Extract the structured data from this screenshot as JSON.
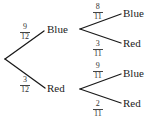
{
  "diagram": {
    "type": "probability-tree",
    "line_color": "#1a1a1a",
    "first_level": [
      {
        "outcome": "Blue",
        "probability": {
          "numerator": "9",
          "denominator": "12"
        },
        "second_level": [
          {
            "outcome": "Blue",
            "probability": {
              "numerator": "8",
              "denominator": "11"
            }
          },
          {
            "outcome": "Red",
            "probability": {
              "numerator": "3",
              "denominator": "11"
            }
          }
        ]
      },
      {
        "outcome": "Red",
        "probability": {
          "numerator": "3",
          "denominator": "12"
        },
        "second_level": [
          {
            "outcome": "Blue",
            "probability": {
              "numerator": "9",
              "denominator": "11"
            }
          },
          {
            "outcome": "Red",
            "probability": {
              "numerator": "2",
              "denominator": "11"
            }
          }
        ]
      }
    ]
  }
}
